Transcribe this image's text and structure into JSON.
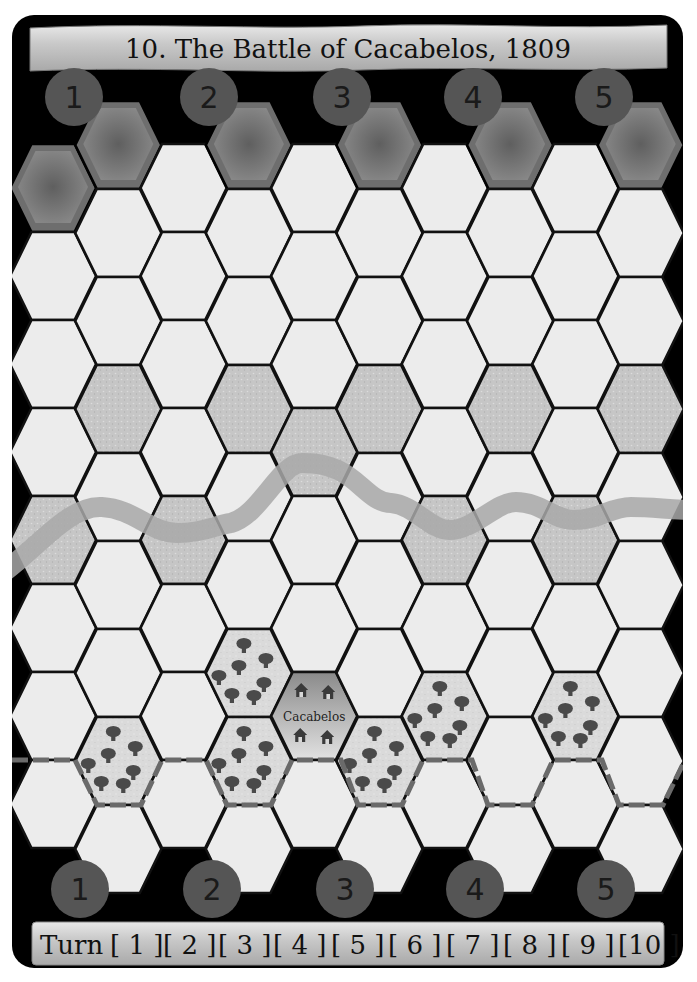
{
  "scenario": {
    "title": "10. The Battle of Cacabelos, 1809"
  },
  "top_deployment_markers": [
    "1",
    "2",
    "3",
    "4",
    "5"
  ],
  "bottom_deployment_markers": [
    "1",
    "2",
    "3",
    "4",
    "5"
  ],
  "turn_track": {
    "label": "Turn",
    "turns": [
      "1",
      "2",
      "3",
      "4",
      "5",
      "6",
      "7",
      "8",
      "9",
      "10"
    ]
  },
  "map": {
    "columns": 10,
    "town": {
      "name": "Cacabelos",
      "col": 4,
      "row": 6
    },
    "terrain_legend": {
      "clear": "clear",
      "river": "river",
      "woods": "woods",
      "town": "town",
      "deployment": "deployment"
    },
    "river_hexes": [
      [
        0,
        4
      ],
      [
        1,
        3
      ],
      [
        2,
        4
      ],
      [
        3,
        3
      ],
      [
        4,
        3
      ],
      [
        5,
        3
      ],
      [
        6,
        4
      ],
      [
        7,
        3
      ],
      [
        8,
        4
      ],
      [
        9,
        3
      ]
    ],
    "woods_hexes": [
      [
        1,
        7
      ],
      [
        3,
        6
      ],
      [
        3,
        7
      ],
      [
        5,
        7
      ],
      [
        6,
        6
      ],
      [
        8,
        6
      ]
    ],
    "deployment_hexes": [
      [
        0,
        0
      ],
      [
        1,
        0
      ],
      [
        3,
        0
      ],
      [
        5,
        0
      ],
      [
        7,
        0
      ],
      [
        9,
        0
      ]
    ]
  },
  "colors": {
    "board_bg": "#000000",
    "hex_clear": "#ececec",
    "hex_river": "#c4c4c4",
    "river_stream": "#a9a9a9",
    "hex_woods": "#d6d6d6",
    "tree": "#4a4a4a",
    "deployment_hex": "#7d7d7d",
    "marker_circle": "#555555",
    "road_dash": "#666666",
    "banner": "#c8c8c8"
  }
}
